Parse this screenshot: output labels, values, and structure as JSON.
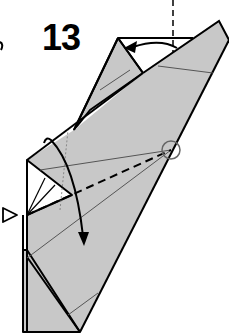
{
  "diagram": {
    "type": "origami-instruction",
    "step_number": "13",
    "colors": {
      "paper": "#c8c8c8",
      "paper_light": "#d4d4d4",
      "line": "#000000",
      "thin_line": "#555555",
      "circle": "#666666",
      "background": "#ffffff"
    },
    "symbols": [
      {
        "name": "valley-fold-line",
        "style": "dashed",
        "note": "from left edge to circled reference point"
      },
      {
        "name": "reference-point-circle",
        "style": "circle"
      },
      {
        "name": "fold-arrow",
        "style": "curved arrow down"
      },
      {
        "name": "push-arrow",
        "style": "hollow triangle pointing right"
      },
      {
        "name": "rotate-arrow",
        "style": "curved arrow left at top"
      },
      {
        "name": "vertical-reference-line",
        "style": "dashed"
      }
    ]
  }
}
